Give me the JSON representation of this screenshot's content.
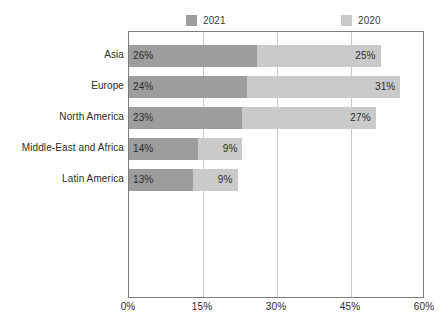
{
  "chart_data": {
    "type": "bar",
    "orientation": "horizontal",
    "stacked": true,
    "title": "",
    "subtitle": "",
    "xlabel": "",
    "ylabel": "",
    "xlim": [
      0,
      60
    ],
    "xticks": [
      "0%",
      "15%",
      "30%",
      "45%",
      "60%"
    ],
    "xtick_values": [
      0,
      15,
      30,
      45,
      60
    ],
    "grid": true,
    "grid_axis": "x",
    "legend_position": "top",
    "categories": [
      "Asia",
      "Europe",
      "North America",
      "Middle-East and Africa",
      "Latin America"
    ],
    "series": [
      {
        "name": "2021",
        "color": "#9d9d9d",
        "values": [
          26,
          24,
          23,
          14,
          13
        ],
        "labels": [
          "26%",
          "24%",
          "23%",
          "14%",
          "13%"
        ]
      },
      {
        "name": "2020",
        "color": "#cacaca",
        "values": [
          25,
          31,
          27,
          9,
          9
        ],
        "labels": [
          "25%",
          "31%",
          "27%",
          "9%",
          "9%"
        ]
      }
    ],
    "colors": {
      "series_2021": "#9d9d9d",
      "series_2020": "#cacaca",
      "frame": "#7b7b7b",
      "gridline": "#c9c9c9",
      "text": "#2b2b2b",
      "background": "#ffffff"
    }
  },
  "legend": {
    "items": [
      {
        "label": "2021",
        "color": "#9d9d9d"
      },
      {
        "label": "2020",
        "color": "#cacaca"
      }
    ]
  }
}
